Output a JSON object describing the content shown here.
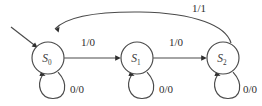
{
  "diagram": {
    "kind": "finite-state-machine",
    "background_color": "#ffffff",
    "line_color": "#4a4a4a",
    "text_color": "#2e2e2e",
    "states": [
      {
        "id": "S0",
        "label": "S",
        "subscript": "0",
        "cx": 48,
        "cy": 58,
        "r": 16,
        "is_initial": true
      },
      {
        "id": "S1",
        "label": "S",
        "subscript": "1",
        "cx": 137,
        "cy": 58,
        "r": 16,
        "is_initial": false
      },
      {
        "id": "S2",
        "label": "S",
        "subscript": "2",
        "cx": 223,
        "cy": 58,
        "r": 16,
        "is_initial": false
      }
    ],
    "transitions": [
      {
        "id": "t-s0-s1",
        "from": "S0",
        "to": "S1",
        "label": "1/0",
        "label_x": 88,
        "label_y": 46,
        "shape": "straight-right"
      },
      {
        "id": "t-s1-s2",
        "from": "S1",
        "to": "S2",
        "label": "1/0",
        "label_x": 176,
        "label_y": 46,
        "shape": "straight-right"
      },
      {
        "id": "t-s2-s0",
        "from": "S2",
        "to": "S0",
        "label": "1/1",
        "label_x": 199,
        "label_y": 12,
        "shape": "arc-over-top"
      },
      {
        "id": "t-s0-s0",
        "from": "S0",
        "to": "S0",
        "label": "0/0",
        "label_x": 77,
        "label_y": 93,
        "shape": "self-loop-below"
      },
      {
        "id": "t-s1-s1",
        "from": "S1",
        "to": "S1",
        "label": "0/0",
        "label_x": 166,
        "label_y": 93,
        "shape": "self-loop-below"
      },
      {
        "id": "t-s2-s2",
        "from": "S2",
        "to": "S2",
        "label": "0/0",
        "label_x": 250,
        "label_y": 93,
        "shape": "self-loop-below"
      }
    ],
    "initial_marker": {
      "id": "initial-arrow",
      "from_x": 11,
      "from_y": 27,
      "to_x": 38,
      "to_y": 48
    }
  }
}
